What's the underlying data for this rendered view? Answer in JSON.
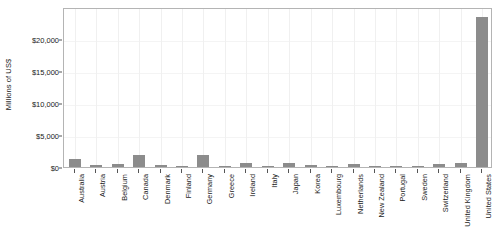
{
  "chart_data": {
    "type": "bar",
    "title": "",
    "xlabel": "",
    "ylabel": "Millions of US$",
    "ylim": [
      0,
      25000
    ],
    "yticks": [
      0,
      5000,
      10000,
      15000,
      20000
    ],
    "ytick_labels": [
      "$0",
      "$5,000",
      "$10,000",
      "$15,000",
      "$20,000"
    ],
    "grid": true,
    "legend": "none",
    "bar_color": "#8c8c8c",
    "categories": [
      "Australia",
      "Austria",
      "Belgium",
      "Canada",
      "Denmark",
      "Finland",
      "Germany",
      "Greece",
      "Ireland",
      "Italy",
      "Japan",
      "Korea",
      "Luxembourg",
      "Netherlands",
      "New Zealand",
      "Portugal",
      "Sweden",
      "Switzerland",
      "United Kingdom",
      "United States"
    ],
    "values": [
      1300,
      280,
      500,
      1900,
      250,
      60,
      1800,
      40,
      600,
      230,
      620,
      250,
      20,
      400,
      110,
      30,
      40,
      430,
      620,
      23500
    ]
  }
}
